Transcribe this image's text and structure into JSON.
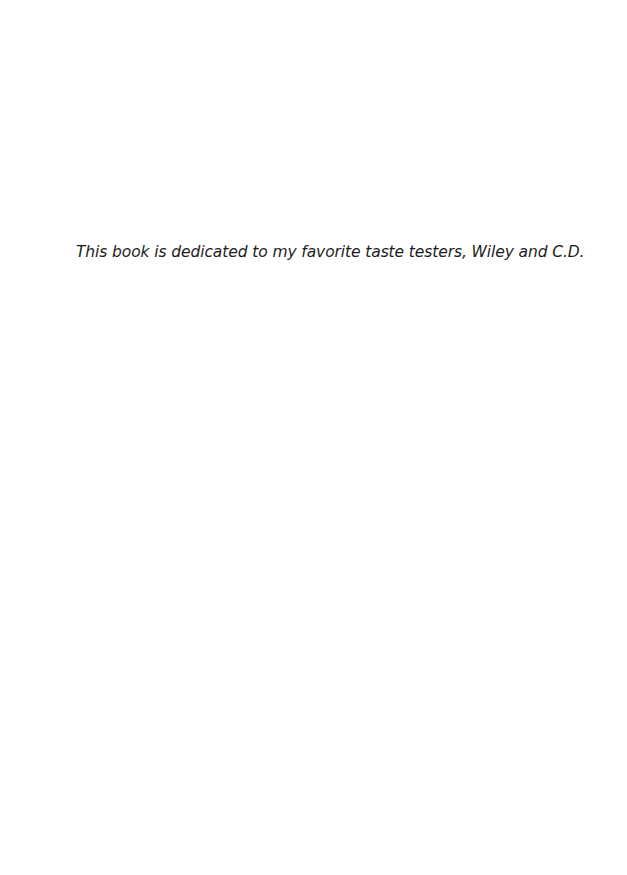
{
  "page": {
    "dedication": "This book is dedicated to my favorite taste testers, Wiley and C.D."
  }
}
